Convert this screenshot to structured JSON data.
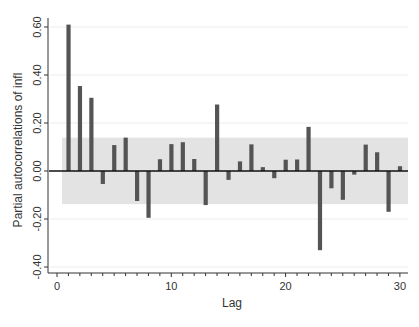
{
  "chart_data": {
    "type": "bar",
    "title": "",
    "xlabel": "Lag",
    "ylabel": "Partial autocorrelations of infl",
    "x": [
      1,
      2,
      3,
      4,
      5,
      6,
      7,
      8,
      9,
      10,
      11,
      12,
      13,
      14,
      15,
      16,
      17,
      18,
      19,
      20,
      21,
      22,
      23,
      24,
      25,
      26,
      27,
      28,
      29,
      30
    ],
    "values": [
      0.61,
      0.354,
      0.305,
      -0.054,
      0.108,
      0.139,
      -0.125,
      -0.195,
      0.049,
      0.112,
      0.12,
      0.05,
      -0.142,
      0.277,
      -0.037,
      0.04,
      0.111,
      0.016,
      -0.03,
      0.047,
      0.048,
      0.184,
      -0.33,
      -0.072,
      -0.12,
      -0.015,
      0.11,
      0.078,
      -0.17,
      0.02
    ],
    "confidence_band": {
      "upper": 0.139,
      "lower": -0.138
    },
    "xlim": [
      0,
      30
    ],
    "ylim": [
      -0.42,
      0.64
    ],
    "xticks": [
      0,
      10,
      20,
      30
    ],
    "xtick_labels": [
      "0",
      "10",
      "20",
      "30"
    ],
    "yticks": [
      0.6,
      0.4,
      0.2,
      0.0,
      -0.2,
      -0.4
    ],
    "ytick_labels": [
      "0.60",
      "0.40",
      "0.20",
      "0.00",
      "-0.20",
      "-0.40"
    ],
    "grid": true,
    "legend": null,
    "colors": {
      "bar": "#545454",
      "band": "#e3e3e3",
      "grid": "#ececec",
      "axis": "#333333"
    }
  }
}
